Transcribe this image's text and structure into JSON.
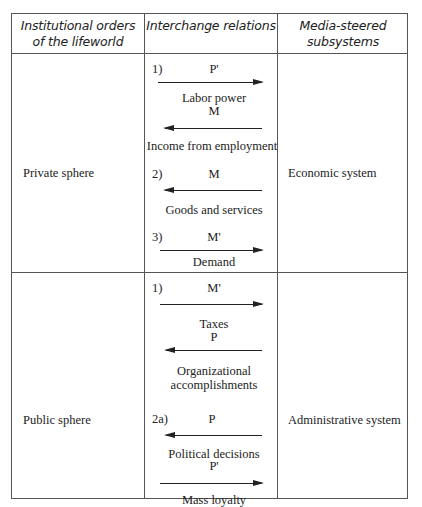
{
  "headers": {
    "col1": [
      "Institutional orders",
      "of the lifeworld"
    ],
    "col2": "Interchange relations",
    "col3": [
      "Media-steered",
      "subsystems"
    ]
  },
  "rows": [
    {
      "lifeworld": "Private sphere",
      "subsystem": "Economic system",
      "relations": [
        {
          "num": "1)",
          "medium": "P'",
          "direction": "right",
          "label": "Labor power"
        },
        {
          "num": "",
          "medium": "M",
          "direction": "left",
          "label": "Income from employment"
        },
        {
          "num": "2)",
          "medium": "M",
          "direction": "left",
          "label": "Goods and services"
        },
        {
          "num": "3)",
          "medium": "M'",
          "direction": "right",
          "label": "Demand"
        }
      ]
    },
    {
      "lifeworld": "Public sphere",
      "subsystem": "Administrative system",
      "relations": [
        {
          "num": "1)",
          "medium": "M'",
          "direction": "right",
          "label": "Taxes"
        },
        {
          "num": "",
          "medium": "P",
          "direction": "left",
          "label_lines": [
            "Organizational",
            "accomplishments"
          ]
        },
        {
          "num": "2a)",
          "medium": "P",
          "direction": "left",
          "label": "Political decisions"
        },
        {
          "num": "",
          "medium": "P'",
          "direction": "right",
          "label": "Mass loyalty"
        }
      ]
    }
  ]
}
